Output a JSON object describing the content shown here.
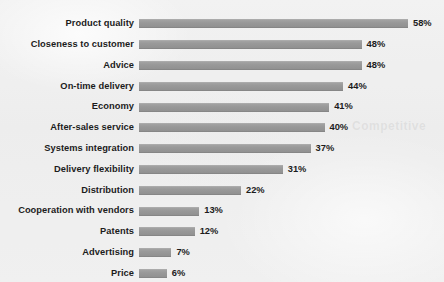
{
  "figure": {
    "background_color": "#efefef",
    "bar_color": "#9a9a9a",
    "text_color": "#1c1c1c",
    "watermark_text": "Competitive"
  },
  "chart_data": {
    "type": "bar",
    "orientation": "horizontal",
    "title": "",
    "subtitle": "",
    "xlabel": "",
    "ylabel": "",
    "grid": false,
    "legend": null,
    "xlim": [
      0,
      58
    ],
    "value_suffix": "%",
    "sorted": "descending",
    "categories": [
      "Product quality",
      "Closeness to customer",
      "Advice",
      "On-time delivery",
      "Economy",
      "After-sales service",
      "Systems integration",
      "Delivery flexibility",
      "Distribution",
      "Cooperation with vendors",
      "Patents",
      "Advertising",
      "Price"
    ],
    "values": [
      58,
      48,
      48,
      44,
      41,
      40,
      37,
      31,
      22,
      13,
      12,
      7,
      6
    ],
    "data_labels": [
      "58%",
      "48%",
      "48%",
      "44%",
      "41%",
      "40%",
      "37%",
      "31%",
      "22%",
      "13%",
      "12%",
      "7%",
      "6%"
    ]
  }
}
